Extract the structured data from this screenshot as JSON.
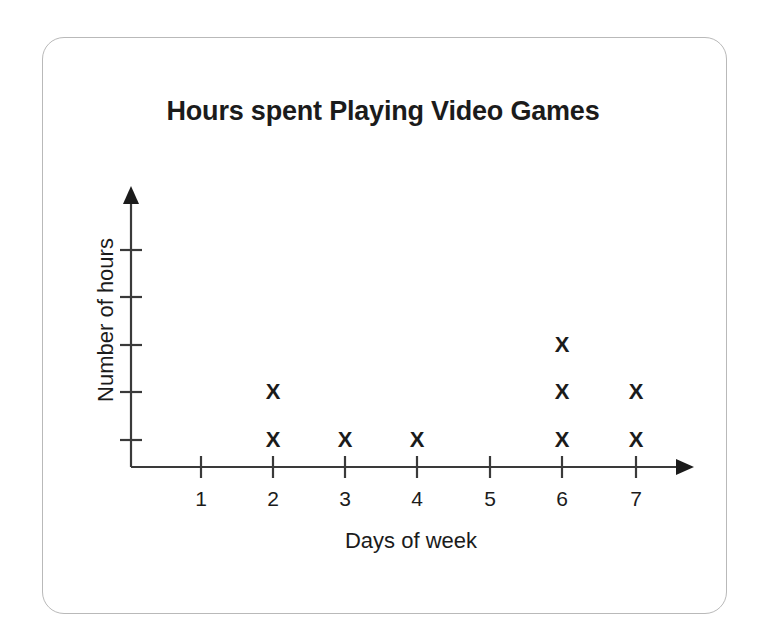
{
  "frame": {
    "border_color": "#b9b9b9",
    "background": "#ffffff"
  },
  "chart_data": {
    "type": "scatter",
    "title": "Hours spent Playing Video Games",
    "xlabel": "Days of week",
    "ylabel": "Number of hours",
    "marker_glyph": "X",
    "marker_color": "#1b1b1b",
    "axis_color": "#3a3a3a",
    "categories": [
      "1",
      "2",
      "3",
      "4",
      "5",
      "6",
      "7"
    ],
    "x": [
      1,
      2,
      3,
      4,
      5,
      6,
      7
    ],
    "values": [
      0,
      2,
      1,
      1,
      0,
      3,
      2
    ],
    "points": [
      {
        "x": 2,
        "y": 1
      },
      {
        "x": 2,
        "y": 2
      },
      {
        "x": 3,
        "y": 1
      },
      {
        "x": 4,
        "y": 1
      },
      {
        "x": 6,
        "y": 1
      },
      {
        "x": 6,
        "y": 2
      },
      {
        "x": 6,
        "y": 3
      },
      {
        "x": 7,
        "y": 1
      },
      {
        "x": 7,
        "y": 2
      }
    ],
    "xlim": [
      0,
      7.6
    ],
    "ylim": [
      0,
      5.4
    ],
    "x_tick_labels": [
      "1",
      "2",
      "3",
      "4",
      "5",
      "6",
      "7"
    ],
    "y_tick_labels": [
      "",
      "",
      "",
      "",
      ""
    ],
    "y_tick_count": 5,
    "grid": false,
    "legend": null,
    "axis_arrows": true
  }
}
